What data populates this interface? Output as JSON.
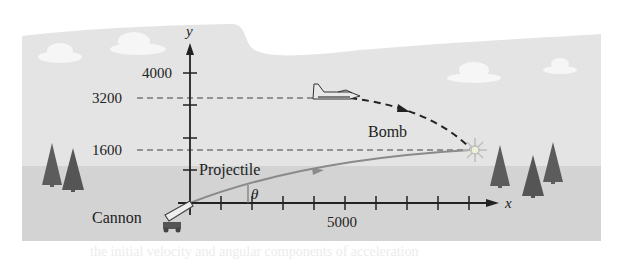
{
  "figure": {
    "labels": {
      "y_axis": "y",
      "x_axis": "x",
      "y_tick_4000": "4000",
      "y_ref_3200": "3200",
      "y_ref_1600": "1600",
      "x_tick_5000": "5000",
      "projectile": "Projectile",
      "bomb": "Bomb",
      "cannon": "Cannon",
      "angle": "θ"
    },
    "colors": {
      "sky": "#e4e4e4",
      "ground": "#d3d3d3",
      "axis": "#222222",
      "projectile_path": "#8a8a8a",
      "dashed": "#777777",
      "bomb_path": "#222222",
      "tree": "#5c5c5c",
      "cloud": "#f6f6f6",
      "explosion": "#f0f0d8"
    },
    "bleed_text": "the initial velocity and angular components of acceleration"
  }
}
